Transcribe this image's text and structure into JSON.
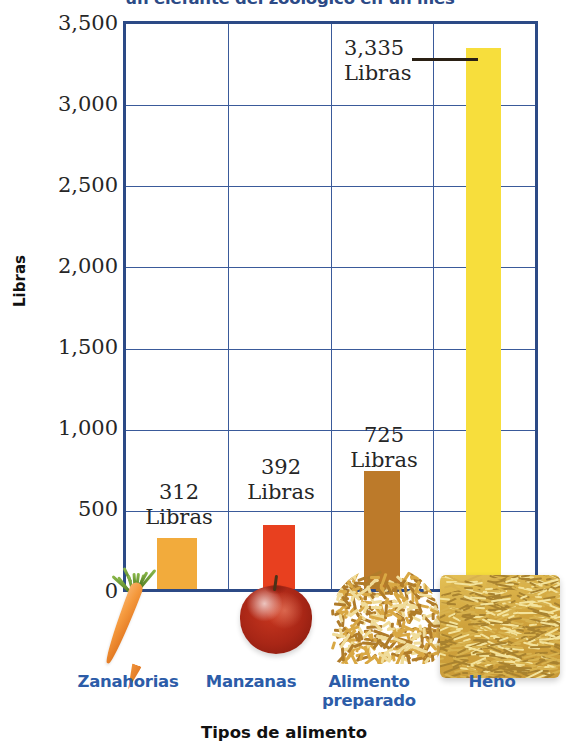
{
  "chart_data": {
    "type": "bar",
    "title": "un elefante del zoológico en un mes",
    "xlabel": "Tipos de alimento",
    "ylabel": "Libras",
    "categories": [
      "Zanahorias",
      "Manzanas",
      "Alimento\npreparado",
      "Heno"
    ],
    "values": [
      312,
      392,
      725,
      3335
    ],
    "value_labels": [
      "312\nLibras",
      "392\nLibras",
      "725\nLibras",
      "3,335\nLibras"
    ],
    "ylim": [
      0,
      3500
    ],
    "ytick_labels": [
      "0",
      "500",
      "1,000",
      "1,500",
      "2,000",
      "2,500",
      "3,000",
      "3,500"
    ],
    "ytick_values": [
      0,
      500,
      1000,
      1500,
      2000,
      2500,
      3000,
      3500
    ],
    "grid": true,
    "legend": "none",
    "bar_colors": [
      "#F2AB3C",
      "#E8401F",
      "#BC7A2A",
      "#F7DE3C"
    ],
    "axis_color": "#2C4A86",
    "category_label_color": "#2C5CA8",
    "title_color": "#2C4A86",
    "units": "Libras",
    "icons": [
      "carrot-image",
      "apple-image",
      "prepared-food-pile-image",
      "hay-bale-image"
    ]
  }
}
